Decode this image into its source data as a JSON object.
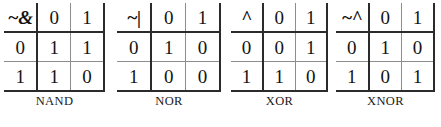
{
  "figure": {
    "col_header_blank": "",
    "tables": [
      {
        "operator_symbol": "~&",
        "caption": "NAND",
        "col_labels": [
          "0",
          "1"
        ],
        "row_labels": [
          "0",
          "1"
        ],
        "rows": [
          [
            "1",
            "1"
          ],
          [
            "1",
            "0"
          ]
        ]
      },
      {
        "operator_symbol": "~|",
        "caption": "NOR",
        "col_labels": [
          "0",
          "1"
        ],
        "row_labels": [
          "0",
          "1"
        ],
        "rows": [
          [
            "1",
            "0"
          ],
          [
            "0",
            "0"
          ]
        ]
      },
      {
        "operator_symbol": "^",
        "caption": "XOR",
        "col_labels": [
          "0",
          "1"
        ],
        "row_labels": [
          "0",
          "1"
        ],
        "rows": [
          [
            "0",
            "1"
          ],
          [
            "1",
            "0"
          ]
        ]
      },
      {
        "operator_symbol": "~^",
        "caption": "XNOR",
        "col_labels": [
          "0",
          "1"
        ],
        "row_labels": [
          "0",
          "1"
        ],
        "rows": [
          [
            "1",
            "0"
          ],
          [
            "0",
            "1"
          ]
        ]
      }
    ]
  },
  "colors": {
    "background": "#ffffff",
    "text": "#1a1a1a",
    "rule_heavy": "#2b2b2b",
    "rule_light": "#8d8d8d"
  }
}
